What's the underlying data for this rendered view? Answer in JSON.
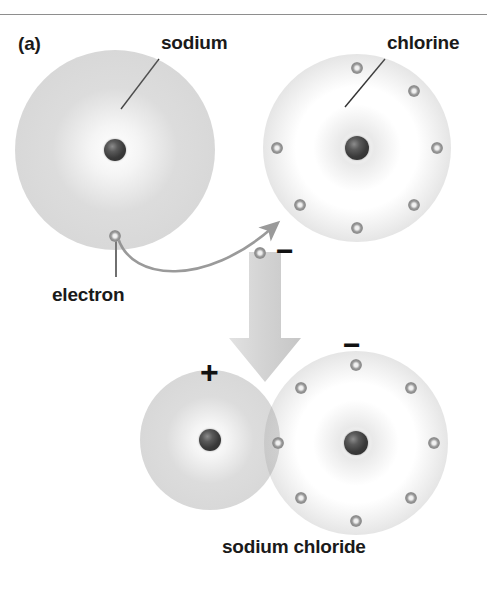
{
  "figure": {
    "panel_label": "(a)",
    "caption": "sodium chloride",
    "background_color": "#ffffff",
    "rule_color": "#8e8e8e"
  },
  "labels": {
    "sodium": "sodium",
    "chlorine": "chlorine",
    "electron": "electron",
    "product": "sodium chloride"
  },
  "signs": {
    "transferred_electron_minus": "−",
    "sodium_ion_plus": "+",
    "chloride_ion_minus": "−"
  },
  "colors": {
    "nucleus": "#2b2b2b",
    "electron": "#8a8a8a",
    "cloud": "#8c8c8c",
    "arrow_block": "#d6d6d6",
    "arrow_curve": "#9a9a9a",
    "leader_line": "#333333",
    "text": "#1a1a1a"
  },
  "atoms": [
    {
      "id": "sodium-atom",
      "name": "sodium",
      "row": "reactants",
      "center": [
        115,
        150
      ],
      "cloud_radius": 86,
      "nucleus_radius": 11,
      "electron_count": 1,
      "electron_angles_deg": [
        90
      ],
      "electron_ring_radius": 86,
      "charge": ""
    },
    {
      "id": "chlorine-atom",
      "name": "chlorine",
      "row": "reactants",
      "center": [
        357,
        148
      ],
      "cloud_radius": 80,
      "nucleus_radius": 12,
      "electron_count": 7,
      "electron_angles_deg": [
        270,
        315,
        0,
        45,
        90,
        135,
        180
      ],
      "electron_ring_radius": 80,
      "charge": ""
    },
    {
      "id": "sodium-ion",
      "name": "sodium ion",
      "row": "products",
      "center": [
        210,
        440
      ],
      "cloud_radius": 56,
      "nucleus_radius": 11,
      "electron_count": 0,
      "electron_angles_deg": [],
      "electron_ring_radius": 0,
      "charge": "+"
    },
    {
      "id": "chloride-ion",
      "name": "chloride ion",
      "row": "products",
      "center": [
        356,
        443
      ],
      "cloud_radius": 78,
      "nucleus_radius": 12,
      "electron_count": 8,
      "electron_angles_deg": [
        270,
        315,
        0,
        45,
        90,
        135,
        180,
        225
      ],
      "electron_ring_radius": 78,
      "charge": "−"
    }
  ],
  "free_electron": {
    "name": "transferred-electron",
    "center": [
      260,
      253
    ],
    "radius": 6
  },
  "arrows": {
    "transfer_curve": {
      "name": "electron-transfer-arrow",
      "from": [
        118,
        237
      ],
      "to": [
        288,
        218
      ],
      "style": "curved"
    },
    "reaction_block": {
      "name": "reaction-arrow",
      "direction": "down",
      "x": 265,
      "top": 250,
      "bottom": 382
    }
  },
  "leaders": [
    {
      "name": "sodium-leader",
      "from": [
        160,
        58
      ],
      "to": [
        121,
        108
      ]
    },
    {
      "name": "chlorine-leader",
      "from": [
        386,
        58
      ],
      "to": [
        347,
        106
      ]
    },
    {
      "name": "electron-leader",
      "from": [
        116,
        276
      ],
      "to": [
        116,
        236
      ]
    }
  ]
}
